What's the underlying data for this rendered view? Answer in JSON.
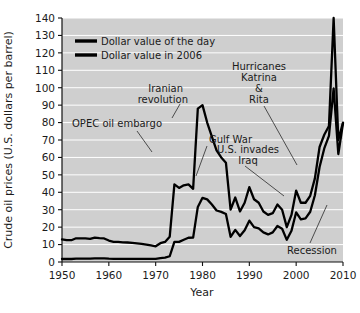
{
  "chart_data": {
    "type": "line",
    "title": "",
    "xlabel": "Year",
    "ylabel": "Crude oil prices (U.S. dollars per barrel)",
    "xlim": [
      1950,
      2010
    ],
    "ylim": [
      0,
      140
    ],
    "xticks": [
      1950,
      1960,
      1970,
      1980,
      1990,
      2000,
      2010
    ],
    "yticks": [
      0,
      10,
      20,
      30,
      40,
      50,
      60,
      70,
      80,
      90,
      100,
      110,
      120,
      130,
      140
    ],
    "grid": "horizontal",
    "legend_position": "upper-left-inside",
    "plot_background": "#cfcfcf",
    "gridline_color": "#ffffff",
    "line_color": "#000000",
    "series": [
      {
        "name": "Dollar value of the day",
        "x": [
          1950,
          1951,
          1952,
          1953,
          1954,
          1955,
          1956,
          1957,
          1958,
          1959,
          1960,
          1961,
          1962,
          1963,
          1964,
          1965,
          1966,
          1967,
          1968,
          1969,
          1970,
          1971,
          1972,
          1973,
          1974,
          1975,
          1976,
          1977,
          1978,
          1979,
          1980,
          1981,
          1982,
          1983,
          1984,
          1985,
          1986,
          1987,
          1988,
          1989,
          1990,
          1991,
          1992,
          1993,
          1994,
          1995,
          1996,
          1997,
          1998,
          1999,
          2000,
          2001,
          2002,
          2003,
          2004,
          2005,
          2006,
          2007,
          2008,
          2009,
          2010
        ],
        "values": [
          1.71,
          1.71,
          1.71,
          1.93,
          1.93,
          1.93,
          1.93,
          2.08,
          2.08,
          2.08,
          1.9,
          1.8,
          1.8,
          1.8,
          1.8,
          1.8,
          1.8,
          1.8,
          1.8,
          1.8,
          1.8,
          2.24,
          2.48,
          3.29,
          11.58,
          11.53,
          12.8,
          13.92,
          14.02,
          31.61,
          36.83,
          35.93,
          32.97,
          29.55,
          28.78,
          27.56,
          14.43,
          18.44,
          14.92,
          18.23,
          23.73,
          20,
          19.32,
          16.97,
          15.82,
          17.02,
          20.67,
          19.09,
          12.72,
          17.97,
          28.5,
          24.44,
          25.02,
          28.83,
          38.27,
          54.52,
          65.14,
          72.39,
          99.67,
          61.95,
          79.5
        ],
        "units": "nominal USD per barrel"
      },
      {
        "name": "Dollar value in 2006",
        "x": [
          1950,
          1951,
          1952,
          1953,
          1954,
          1955,
          1956,
          1957,
          1958,
          1959,
          1960,
          1961,
          1962,
          1963,
          1964,
          1965,
          1966,
          1967,
          1968,
          1969,
          1970,
          1971,
          1972,
          1973,
          1974,
          1975,
          1976,
          1977,
          1978,
          1979,
          1980,
          1981,
          1982,
          1983,
          1984,
          1985,
          1986,
          1987,
          1988,
          1989,
          1990,
          1991,
          1992,
          1993,
          1994,
          1995,
          1996,
          1997,
          1998,
          1999,
          2000,
          2001,
          2002,
          2003,
          2004,
          2005,
          2006,
          2007,
          2008,
          2009,
          2010
        ],
        "values": [
          13,
          12.5,
          12.5,
          13.6,
          13.5,
          13.5,
          13.3,
          14,
          13.7,
          13.5,
          12.3,
          11.6,
          11.5,
          11.3,
          11.2,
          11,
          10.7,
          10.4,
          10,
          9.5,
          9,
          10.8,
          11.5,
          14.5,
          44.5,
          42.5,
          44,
          44.5,
          42,
          88,
          90,
          80,
          72,
          64,
          60,
          57,
          30,
          37,
          29,
          34,
          43,
          36,
          34,
          29,
          27,
          28,
          33,
          30,
          20,
          27,
          41,
          34,
          34,
          38,
          48,
          66,
          73,
          78,
          140,
          70,
          80
        ],
        "units": "inflation-adjusted 2006 USD per barrel"
      }
    ],
    "annotations": [
      {
        "label": "OPEC oil embargo",
        "lines": [
          "OPEC oil embargo"
        ],
        "points_to_year": 1974,
        "points_to_value": 44
      },
      {
        "label": "Iranian revolution",
        "lines": [
          "Iranian",
          "revolution"
        ],
        "points_to_year": 1980,
        "points_to_value": 90
      },
      {
        "label": "Gulf War",
        "lines": [
          "Gulf War"
        ],
        "points_to_year": 1990,
        "points_to_value": 43
      },
      {
        "label": "Hurricanes Katrina & Rita",
        "lines": [
          "Hurricanes",
          "Katrina",
          "&",
          "Rita"
        ],
        "points_to_year": 2005,
        "points_to_value": 66
      },
      {
        "label": "U.S. invades Iraq",
        "lines": [
          "U.S. invades",
          "Iraq"
        ],
        "points_to_year": 2003,
        "points_to_value": 38
      },
      {
        "label": "Recession",
        "lines": [
          "Recession"
        ],
        "points_to_year": 2009,
        "points_to_value": 70
      }
    ]
  },
  "legend": {
    "items": [
      {
        "label": "Dollar value of the day"
      },
      {
        "label": "Dollar value in 2006"
      }
    ]
  },
  "axes": {
    "y_title": "Crude oil prices (U.S. dollars per barrel)",
    "x_title": "Year",
    "y_tick_labels": [
      "0",
      "10",
      "20",
      "30",
      "40",
      "50",
      "60",
      "70",
      "80",
      "90",
      "100",
      "110",
      "120",
      "130",
      "140"
    ],
    "x_tick_labels": [
      "1950",
      "1960",
      "1970",
      "1980",
      "1990",
      "2000",
      "2010"
    ]
  },
  "annotation_labels": {
    "opec": "OPEC oil embargo",
    "iranian_1": "Iranian",
    "iranian_2": "revolution",
    "gulf_war": "Gulf War",
    "hurricanes_1": "Hurricanes",
    "hurricanes_2": "Katrina",
    "hurricanes_3": "&",
    "hurricanes_4": "Rita",
    "iraq_1": "U.S. invades",
    "iraq_2": "Iraq",
    "recession": "Recession"
  }
}
